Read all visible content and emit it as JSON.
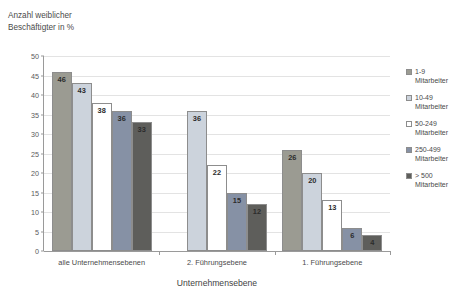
{
  "chart_data": {
    "type": "bar",
    "title": "",
    "ylabel_line1": "Anzahl weiblicher",
    "ylabel_line2": "Beschäftigter in %",
    "xlabel": "Unternehmensebene",
    "categories": [
      "alle Unternehmensebenen",
      "2. Führungsebene",
      "1. Führungsebene"
    ],
    "series": [
      {
        "name": "1-9 Mitarbeiter",
        "label_line1": "1-9",
        "label_line2": "Mitarbeiter",
        "color": "#9b9b92",
        "values": [
          46,
          null,
          26
        ]
      },
      {
        "name": "10-49 Mitarbeiter",
        "label_line1": "10-49",
        "label_line2": "Mitarbeiter",
        "color": "#ccd3dc",
        "values": [
          43,
          36,
          20
        ]
      },
      {
        "name": "50-249 Mitarbeiter",
        "label_line1": "50-249",
        "label_line2": "Mitarbeiter",
        "color": "#ffffff",
        "values": [
          38,
          22,
          13
        ]
      },
      {
        "name": "250-499 Mitarbeiter",
        "label_line1": "250-499",
        "label_line2": "Mitarbeiter",
        "color": "#8691a5",
        "values": [
          36,
          15,
          6
        ]
      },
      {
        "name": "> 500 Mitarbeiter",
        "label_line1": "> 500",
        "label_line2": "Mitarbeiter",
        "color": "#5e5e5b",
        "values": [
          33,
          12,
          4
        ]
      }
    ],
    "ylim": [
      0,
      50
    ],
    "ytick_step": 5,
    "yticks": [
      0,
      5,
      10,
      15,
      20,
      25,
      30,
      35,
      40,
      45,
      50
    ],
    "grid": true,
    "legend_position": "right",
    "gridline_color": "#e3e3e3",
    "axis_color": "#9a9a9a",
    "bar_border_color": "#8d8d8d"
  }
}
